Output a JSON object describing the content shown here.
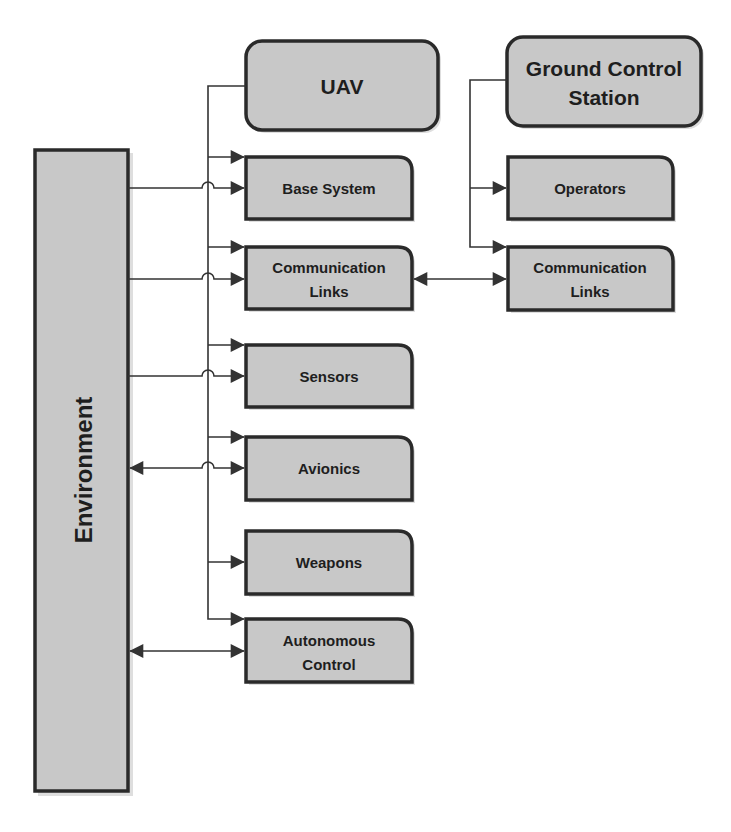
{
  "diagram": {
    "title": "",
    "nodes": {
      "environment": {
        "label": "Environment"
      },
      "uav": {
        "label": "UAV"
      },
      "base_system": {
        "label": "Base System"
      },
      "uav_comm_links": {
        "line1": "Communication",
        "line2": "Links"
      },
      "sensors": {
        "label": "Sensors"
      },
      "avionics": {
        "label": "Avionics"
      },
      "weapons": {
        "label": "Weapons"
      },
      "autonomous_control": {
        "line1": "Autonomous",
        "line2": "Control"
      },
      "gcs": {
        "line1": "Ground Control",
        "line2": "Station"
      },
      "operators": {
        "label": "Operators"
      },
      "gcs_comm_links": {
        "line1": "Communication",
        "line2": "Links"
      }
    },
    "edges": [
      {
        "from": "UAV",
        "to": "Base System",
        "type": "arrow"
      },
      {
        "from": "UAV",
        "to": "Communication Links",
        "type": "arrow"
      },
      {
        "from": "UAV",
        "to": "Sensors",
        "type": "arrow"
      },
      {
        "from": "UAV",
        "to": "Avionics",
        "type": "arrow"
      },
      {
        "from": "UAV",
        "to": "Weapons",
        "type": "arrow"
      },
      {
        "from": "UAV",
        "to": "Autonomous Control",
        "type": "arrow"
      },
      {
        "from": "Environment",
        "to": "Base System",
        "type": "arrow"
      },
      {
        "from": "Environment",
        "to": "Communication Links",
        "type": "arrow"
      },
      {
        "from": "Environment",
        "to": "Sensors",
        "type": "arrow"
      },
      {
        "from": "Environment",
        "to": "Avionics",
        "type": "bidirectional"
      },
      {
        "from": "Environment",
        "to": "Autonomous Control",
        "type": "bidirectional"
      },
      {
        "from": "Ground Control Station",
        "to": "Operators",
        "type": "arrow"
      },
      {
        "from": "Ground Control Station",
        "to": "Communication Links (GCS)",
        "type": "arrow"
      },
      {
        "from": "Communication Links (UAV)",
        "to": "Communication Links (GCS)",
        "type": "bidirectional"
      }
    ],
    "colors": {
      "box_fill": "#c8c8c8",
      "box_stroke": "#2a2a2a",
      "line": "#333333",
      "text": "#1e1e1e",
      "background": "#ffffff"
    }
  }
}
